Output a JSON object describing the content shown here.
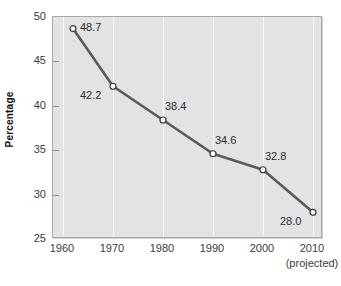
{
  "chart_data": {
    "type": "line",
    "title": "",
    "subtitle": "",
    "xlabel": "",
    "ylabel": "Percentage",
    "x_note": "(projected)",
    "xlim": [
      1958,
      2012
    ],
    "ylim": [
      25,
      50
    ],
    "ytick_step": 5,
    "grid": "vertical-only",
    "legend": "none",
    "line_color": "#5a5a5a",
    "marker_face_color": "#ffffff",
    "marker_edge_color": "#3a3a3a",
    "plot_bg_color": "#e3e3e3",
    "gridline_color": "#f7f7f7",
    "x_tick_labels": [
      "1960",
      "1970",
      "1980",
      "1990",
      "2000",
      "2010"
    ],
    "x_ticks": [
      1960,
      1970,
      1980,
      1990,
      2000,
      2010
    ],
    "y_tick_labels": [
      "25",
      "30",
      "35",
      "40",
      "45",
      "50"
    ],
    "y_ticks": [
      25,
      30,
      35,
      40,
      45,
      50
    ],
    "x": [
      1962,
      1970,
      1980,
      1990,
      2000,
      2010
    ],
    "values": [
      48.7,
      42.2,
      38.4,
      34.6,
      32.8,
      28.0
    ],
    "point_labels": [
      "48.7",
      "42.2",
      "38.4",
      "34.6",
      "32.8",
      "28.0"
    ],
    "point_label_positions": [
      "right",
      "below-left",
      "above-right",
      "above-right",
      "above-right",
      "below-left"
    ]
  }
}
